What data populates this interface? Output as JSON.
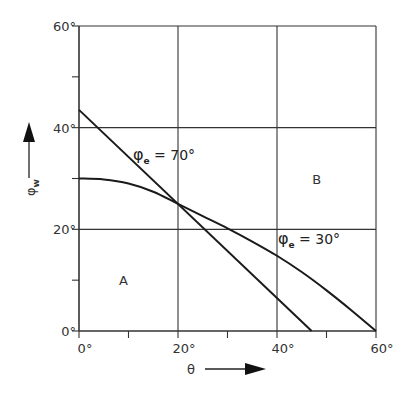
{
  "chart_data": {
    "type": "line",
    "title": "",
    "xlabel": "θ",
    "ylabel": "φw",
    "xlim": [
      0,
      60
    ],
    "ylim": [
      0,
      60
    ],
    "grid": true,
    "x_ticks": [
      "0°",
      "20°",
      "40°",
      "60°"
    ],
    "y_ticks": [
      "0°",
      "20°",
      "40°",
      "60°"
    ],
    "series": [
      {
        "name": "φe = 70°",
        "label_main": "φ",
        "label_sub": "e",
        "label_value": " = 70°",
        "x": [
          0,
          20,
          40,
          47
        ],
        "y": [
          43.5,
          25,
          7,
          0
        ]
      },
      {
        "name": "φe = 30°",
        "label_main": "φ",
        "label_sub": "e",
        "label_value": " = 30°",
        "x": [
          0,
          5,
          10,
          15,
          20,
          25,
          30,
          35,
          40,
          45,
          50,
          55,
          60
        ],
        "y": [
          30,
          29.8,
          29,
          27.4,
          25,
          22.6,
          20.2,
          17.6,
          14.8,
          11.6,
          8.0,
          4.1,
          0
        ]
      }
    ],
    "annotations": [
      {
        "text": "A",
        "x": 9,
        "y": 10
      },
      {
        "text": "B",
        "x": 48,
        "y": 30
      }
    ]
  },
  "axes": {
    "x_label": "θ",
    "y_label_main": "φ",
    "y_label_sub": "w"
  }
}
